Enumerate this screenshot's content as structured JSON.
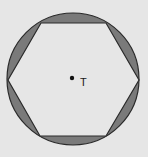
{
  "diagram": {
    "label": "T",
    "colors": {
      "background": "#e6e6e6",
      "circle_fill": "#7a7a7a",
      "hexagon_fill": "#e6e6e6",
      "stroke": "#2a2a2a"
    },
    "circle": {
      "cx": 73,
      "cy": 79,
      "r": 66
    },
    "hexagon_points": "41,23 106,23 139,80 106,136 40,136 8,80",
    "point": {
      "cx": 72,
      "cy": 78,
      "r": 2.2
    }
  }
}
